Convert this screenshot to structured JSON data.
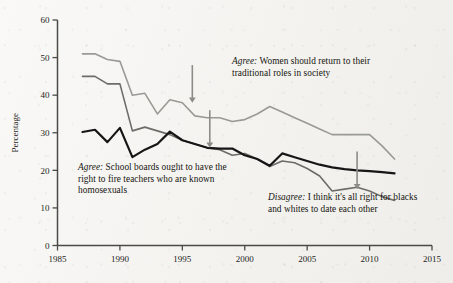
{
  "chart_data": {
    "type": "line",
    "title": "",
    "xlabel": "",
    "ylabel": "Percentage",
    "xlim": [
      1985,
      2015
    ],
    "ylim": [
      0,
      60
    ],
    "grid": false,
    "legend_position": "inline-annotations",
    "x_ticks": [
      "1985",
      "1990",
      "1995",
      "2000",
      "2005",
      "2010",
      "2015"
    ],
    "y_ticks": [
      "0",
      "10",
      "20",
      "30",
      "40",
      "50",
      "60"
    ],
    "series": [
      {
        "name": "Agree: Women should return to their traditional roles in society",
        "color": "#9a9a95",
        "width": 1.6,
        "x": [
          1987,
          1988,
          1989,
          1990,
          1991,
          1992,
          1993,
          1994,
          1995,
          1996,
          1997,
          1998,
          1999,
          2000,
          2001,
          2002,
          2003,
          2004,
          2005,
          2006,
          2007,
          2008,
          2009,
          2010,
          2011,
          2012
        ],
        "values": [
          51.0,
          51.0,
          49.5,
          49.0,
          40.0,
          40.5,
          35.0,
          38.8,
          38.0,
          34.5,
          34.0,
          34.0,
          33.0,
          33.5,
          35.0,
          37.0,
          35.5,
          34.0,
          32.5,
          31.0,
          29.5,
          29.5,
          29.5,
          29.5,
          26.5,
          23.0
        ]
      },
      {
        "name": "Disagree: I think it's all right for blacks and whites to date each other",
        "color": "#6d6d68",
        "width": 1.6,
        "x": [
          1987,
          1988,
          1989,
          1990,
          1991,
          1992,
          1993,
          1994,
          1995,
          1996,
          1997,
          1998,
          1999,
          2000,
          2001,
          2002,
          2003,
          2004,
          2005,
          2006,
          2007,
          2008,
          2009,
          2010,
          2011,
          2012
        ],
        "values": [
          45.0,
          45.0,
          43.0,
          43.0,
          30.5,
          31.5,
          30.5,
          29.5,
          28.0,
          27.0,
          26.0,
          25.5,
          24.0,
          24.5,
          23.0,
          21.0,
          22.5,
          22.0,
          20.5,
          18.5,
          14.5,
          15.0,
          15.5,
          14.5,
          13.0,
          12.0
        ]
      },
      {
        "name": "Agree: School boards ought to have the right to fire teachers who are known homosexuals",
        "color": "#161616",
        "width": 2.2,
        "x": [
          1987,
          1988,
          1989,
          1990,
          1991,
          1992,
          1993,
          1994,
          1995,
          1996,
          1997,
          1998,
          1999,
          2000,
          2001,
          2002,
          2003,
          2004,
          2005,
          2006,
          2007,
          2008,
          2009,
          2010,
          2011,
          2012
        ],
        "values": [
          30.2,
          30.8,
          27.5,
          31.3,
          23.5,
          25.5,
          27.0,
          30.3,
          28.0,
          27.0,
          26.0,
          25.8,
          25.8,
          24.0,
          23.0,
          21.2,
          24.5,
          23.5,
          22.5,
          21.5,
          20.8,
          20.3,
          20.0,
          19.8,
          19.5,
          19.2
        ]
      }
    ],
    "annotations": [
      {
        "id": "women",
        "emphasis": "Agree:",
        "text": " Women should return to their traditional roles in society",
        "arrow": {
          "x": 1995.8,
          "y_top": 38,
          "y_bottom": 48
        }
      },
      {
        "id": "school",
        "emphasis": "Agree:",
        "text": " School boards ought to have the right to fire teachers who are known homosexuals",
        "arrow": {
          "x": 1997.2,
          "y_top": 26,
          "y_bottom": 36
        }
      },
      {
        "id": "date",
        "emphasis": "Disagree:",
        "text": " I think it's all right for blacks and whites to date each other",
        "arrow": {
          "x": 2009.0,
          "y_top": 15,
          "y_bottom": 25
        }
      }
    ]
  },
  "axes": {
    "y_title": "Percentage"
  },
  "annotations_text": {
    "women": {
      "emphasis": "Agree:",
      "rest": " Women should return to their traditional roles in society"
    },
    "school": {
      "emphasis": "Agree:",
      "rest": " School boards ought to have the right to fire teachers who are known homosexuals"
    },
    "date": {
      "emphasis": "Disagree:",
      "rest": " I think it's all right for blacks and whites to date each other"
    }
  }
}
